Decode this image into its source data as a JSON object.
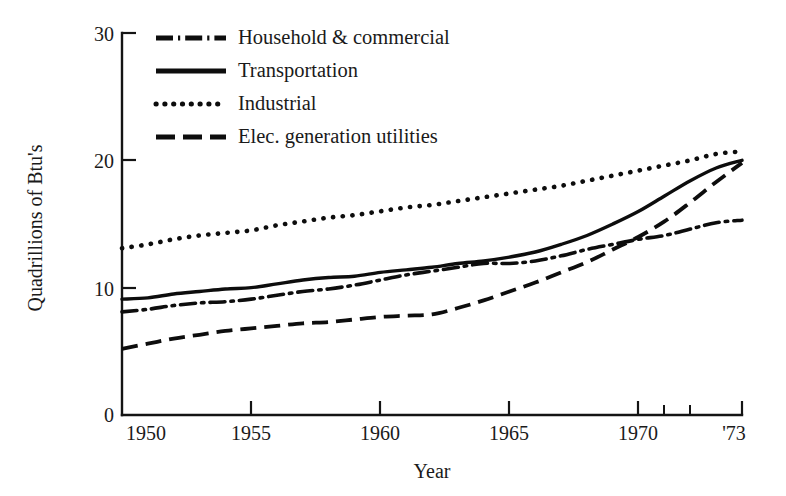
{
  "chart_data": {
    "type": "line",
    "title": "",
    "xlabel": "Year",
    "ylabel": "Quadrillions of Btu's",
    "xlim": [
      1949,
      1973
    ],
    "ylim": [
      0,
      30
    ],
    "yticks": [
      "0",
      "10",
      "20",
      "30"
    ],
    "ytick_values": [
      0,
      10,
      20,
      30
    ],
    "xticks": [
      "1950",
      "1955",
      "1960",
      "1965",
      "1970",
      "'73"
    ],
    "xtick_values": [
      1950,
      1955,
      1960,
      1965,
      1970,
      1973
    ],
    "xminor_ticks": [
      1971,
      1972
    ],
    "grid": false,
    "legend_position": "upper-left-inside",
    "x": [
      1949,
      1950,
      1951,
      1952,
      1953,
      1954,
      1955,
      1956,
      1957,
      1958,
      1959,
      1960,
      1961,
      1962,
      1963,
      1964,
      1965,
      1966,
      1967,
      1968,
      1969,
      1970,
      1971,
      1972,
      1973
    ],
    "series": [
      {
        "name": "Household & commercial",
        "style": "dash-dot",
        "values": [
          8.1,
          8.3,
          8.6,
          8.8,
          8.9,
          9.1,
          9.4,
          9.7,
          9.9,
          10.2,
          10.6,
          11.0,
          11.3,
          11.6,
          11.9,
          11.9,
          12.1,
          12.5,
          13.0,
          13.4,
          13.8,
          14.1,
          14.6,
          15.1,
          15.3
        ]
      },
      {
        "name": "Transportation",
        "style": "solid",
        "values": [
          9.1,
          9.2,
          9.5,
          9.7,
          9.9,
          10.0,
          10.3,
          10.6,
          10.8,
          10.9,
          11.2,
          11.4,
          11.6,
          11.9,
          12.1,
          12.4,
          12.8,
          13.4,
          14.1,
          15.0,
          16.0,
          17.2,
          18.4,
          19.4,
          20.0
        ]
      },
      {
        "name": "Industrial",
        "style": "dotted",
        "values": [
          13.1,
          13.4,
          13.8,
          14.1,
          14.3,
          14.5,
          14.9,
          15.2,
          15.5,
          15.7,
          16.0,
          16.3,
          16.5,
          16.8,
          17.1,
          17.4,
          17.7,
          18.0,
          18.4,
          18.8,
          19.2,
          19.6,
          20.0,
          20.5,
          20.7
        ]
      },
      {
        "name": "Elec. generation utilities",
        "style": "dashed",
        "values": [
          5.2,
          5.6,
          6.0,
          6.3,
          6.6,
          6.8,
          7.0,
          7.2,
          7.3,
          7.5,
          7.7,
          7.8,
          7.9,
          8.4,
          9.0,
          9.7,
          10.4,
          11.2,
          12.0,
          13.0,
          14.0,
          15.2,
          16.7,
          18.3,
          19.8
        ]
      }
    ]
  },
  "legend": {
    "items": [
      {
        "label": "Household & commercial",
        "style": "dash-dot"
      },
      {
        "label": "Transportation",
        "style": "solid"
      },
      {
        "label": "Industrial",
        "style": "dotted"
      },
      {
        "label": "Elec. generation utilities",
        "style": "dashed"
      }
    ]
  }
}
